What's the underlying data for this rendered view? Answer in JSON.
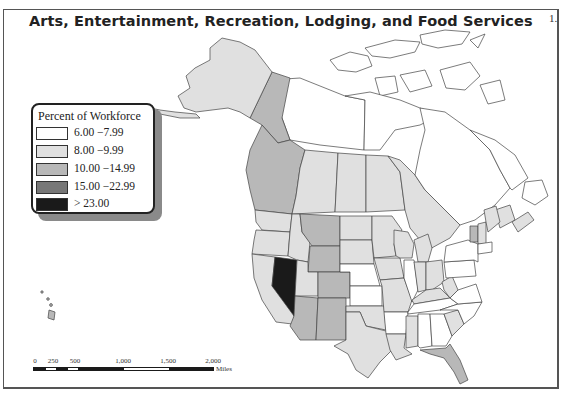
{
  "map": {
    "title": "Arts, Entertainment, Recreation, Lodging, and Food Services",
    "page_marker": "1.",
    "region": "North America (United States and Canada)",
    "colors": {
      "class_1": "#ffffff",
      "class_2": "#e0e0e0",
      "class_3": "#b8b8b8",
      "class_4": "#777777",
      "class_5": "#1a1a1a",
      "outline": "#444444"
    }
  },
  "legend": {
    "title": "Percent of Workforce",
    "classes": [
      {
        "label": "6.00 −7.99",
        "color": "#ffffff"
      },
      {
        "label": "8.00 −9.99",
        "color": "#e0e0e0"
      },
      {
        "label": "10.00 −14.99",
        "color": "#b8b8b8"
      },
      {
        "label": "15.00 −22.99",
        "color": "#777777"
      },
      {
        "label": "> 23.00",
        "color": "#1a1a1a"
      }
    ]
  },
  "scale_bar": {
    "ticks": [
      "0",
      "250",
      "500",
      "1,000",
      "1,500",
      "2,000"
    ],
    "units": "Miles"
  },
  "regions": {
    "class_5": [
      "Nevada"
    ],
    "class_3": [
      "Yukon",
      "British Columbia",
      "Montana",
      "Wyoming",
      "Colorado",
      "Arizona",
      "New Mexico",
      "Vermont",
      "Florida",
      "Hawaii"
    ],
    "class_1": [
      "Nunavut",
      "Northwest Territories",
      "Quebec",
      "Newfoundland and Labrador",
      "Nebraska",
      "Kansas",
      "Illinois",
      "Arkansas",
      "Tennessee",
      "Alabama",
      "Georgia",
      "North Carolina",
      "Virginia",
      "Pennsylvania",
      "New York"
    ],
    "class_2": [
      "Alaska",
      "Alberta",
      "Saskatchewan",
      "Manitoba",
      "Ontario",
      "Washington",
      "Oregon",
      "California",
      "Idaho",
      "Utah",
      "North Dakota",
      "South Dakota",
      "Minnesota",
      "Iowa",
      "Missouri",
      "Oklahoma",
      "Texas",
      "Louisiana",
      "Mississippi",
      "Wisconsin",
      "Michigan",
      "Indiana",
      "Ohio",
      "Kentucky",
      "West Virginia",
      "South Carolina",
      "Maine",
      "New Hampshire",
      "Nova Scotia",
      "New Brunswick"
    ]
  }
}
